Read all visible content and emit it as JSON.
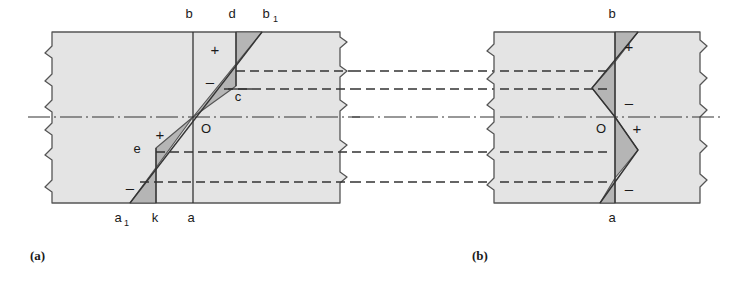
{
  "figure": {
    "title": "",
    "colors": {
      "body_fill": "#e4e4e4",
      "wedge_fill": "#b5b5b5",
      "outline": "#555555",
      "line": "#333333",
      "text": "#1a1a1a",
      "background": "#ffffff"
    },
    "panels": [
      {
        "id": "a",
        "caption": "(a)",
        "top_labels": [
          {
            "name": "label-b",
            "text": "b",
            "sub": ""
          },
          {
            "name": "label-d",
            "text": "d",
            "sub": ""
          },
          {
            "name": "label-b1",
            "text": "b",
            "sub": "1"
          }
        ],
        "bottom_labels": [
          {
            "name": "label-a1",
            "text": "a",
            "sub": "1"
          },
          {
            "name": "label-k",
            "text": "k",
            "sub": ""
          },
          {
            "name": "label-a",
            "text": "a",
            "sub": ""
          }
        ],
        "inner_labels": [
          {
            "name": "label-c",
            "text": "c"
          },
          {
            "name": "label-e",
            "text": "e"
          },
          {
            "name": "label-o",
            "text": "O"
          }
        ],
        "signs": [
          {
            "name": "sign-plus-upper",
            "text": "+"
          },
          {
            "name": "sign-minus-upper",
            "text": "–"
          },
          {
            "name": "sign-plus-lower",
            "text": "+"
          },
          {
            "name": "sign-minus-lower",
            "text": "–"
          }
        ]
      },
      {
        "id": "b",
        "caption": "(b)",
        "top_labels": [
          {
            "name": "label-b",
            "text": "b",
            "sub": ""
          }
        ],
        "bottom_labels": [
          {
            "name": "label-a",
            "text": "a",
            "sub": ""
          }
        ],
        "inner_labels": [
          {
            "name": "label-o",
            "text": "O"
          }
        ],
        "signs": [
          {
            "name": "sign-plus-upper",
            "text": "+"
          },
          {
            "name": "sign-minus-upper",
            "text": "–"
          },
          {
            "name": "sign-plus-lower",
            "text": "+"
          },
          {
            "name": "sign-minus-lower",
            "text": "–"
          }
        ]
      }
    ]
  }
}
